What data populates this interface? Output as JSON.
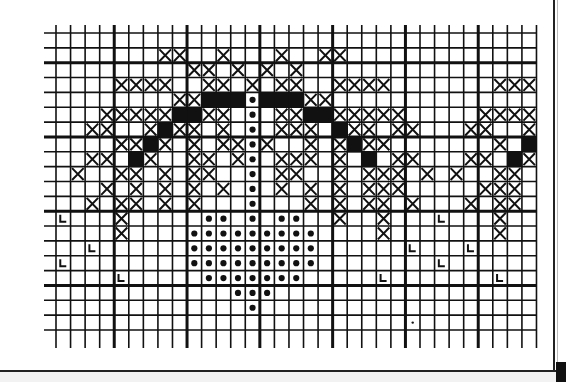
{
  "chart": {
    "grid": {
      "origin_x": 56,
      "origin_y": 33,
      "cell_w": 14.56,
      "cell_h": 14.85,
      "cols": 33,
      "rows": 20,
      "thick_every": 5,
      "thick_col_offset": 4,
      "thick_row_offset": 2,
      "line_overhang_top": 8,
      "line_overhang_bottom": 18,
      "line_overhang_left": 12
    },
    "legend": {
      "X": "cross-stitch",
      "B": "solid filled stitch",
      "D": "dot stitch",
      "L": "L-symbol stitch",
      "s": "small dot"
    },
    "colors": {
      "ink": "#111111",
      "paper": "#ffffff"
    },
    "rows": [
      {
        "X": [],
        "B": [],
        "D": [],
        "L": []
      },
      {
        "X": [
          7,
          8,
          11,
          15,
          18,
          19
        ],
        "B": [],
        "D": [],
        "L": []
      },
      {
        "X": [
          9,
          10,
          12,
          14,
          16
        ],
        "B": [],
        "D": [],
        "L": []
      },
      {
        "X": [
          4,
          5,
          6,
          7,
          10,
          11,
          13,
          15,
          16,
          19,
          20,
          21,
          22,
          30,
          31,
          32
        ],
        "B": [],
        "D": [],
        "L": []
      },
      {
        "X": [
          8,
          9,
          17,
          18
        ],
        "B": [
          10,
          11,
          12,
          14,
          15,
          16
        ],
        "D": [
          13
        ],
        "L": []
      },
      {
        "X": [
          3,
          4,
          5,
          6,
          7,
          10,
          11,
          15,
          16,
          19,
          20,
          21,
          22,
          23,
          29,
          30,
          31,
          32
        ],
        "B": [
          8,
          9,
          17,
          18
        ],
        "D": [
          13
        ],
        "L": []
      },
      {
        "X": [
          2,
          3,
          6,
          8,
          9,
          11,
          15,
          16,
          17,
          20,
          21,
          23,
          24,
          28,
          29,
          32
        ],
        "B": [
          7,
          19
        ],
        "D": [
          13
        ],
        "L": []
      },
      {
        "X": [
          4,
          5,
          7,
          9,
          11,
          12,
          14,
          17,
          19,
          21,
          22,
          30
        ],
        "B": [
          6,
          20,
          32
        ],
        "D": [
          13
        ],
        "L": []
      },
      {
        "X": [
          2,
          3,
          6,
          9,
          10,
          12,
          15,
          16,
          17,
          19,
          23,
          24,
          28,
          29,
          32
        ],
        "B": [
          5,
          21,
          31
        ],
        "D": [
          13
        ],
        "L": []
      },
      {
        "X": [
          1,
          4,
          5,
          7,
          9,
          10,
          15,
          16,
          19,
          21,
          22,
          23,
          25,
          27,
          30,
          31
        ],
        "B": [],
        "D": [
          13
        ],
        "L": []
      },
      {
        "X": [
          3,
          5,
          7,
          9,
          11,
          15,
          17,
          19,
          21,
          22,
          23,
          29,
          30,
          31
        ],
        "B": [],
        "D": [
          13
        ],
        "L": []
      },
      {
        "X": [
          2,
          4,
          5,
          7,
          9,
          17,
          19,
          21,
          22,
          24,
          28,
          30,
          31
        ],
        "B": [],
        "D": [
          13
        ],
        "L": []
      },
      {
        "X": [
          4,
          19,
          22,
          30
        ],
        "B": [],
        "D": [
          10,
          11,
          13,
          15,
          16
        ],
        "L": [
          0,
          26
        ]
      },
      {
        "X": [
          4,
          22,
          30
        ],
        "B": [],
        "D": [
          9,
          10,
          11,
          12,
          13,
          14,
          15,
          16,
          17
        ],
        "L": []
      },
      {
        "X": [],
        "B": [],
        "D": [
          9,
          10,
          11,
          12,
          13,
          14,
          15,
          16,
          17
        ],
        "L": [
          2,
          24,
          28
        ]
      },
      {
        "X": [],
        "B": [],
        "D": [
          9,
          10,
          11,
          12,
          13,
          14,
          15,
          16,
          17
        ],
        "L": [
          0,
          26
        ]
      },
      {
        "X": [],
        "B": [],
        "D": [
          10,
          11,
          12,
          13,
          14,
          15,
          16
        ],
        "L": [
          4,
          22,
          30
        ]
      },
      {
        "X": [],
        "B": [],
        "D": [
          12,
          13,
          14
        ],
        "L": []
      },
      {
        "X": [],
        "B": [],
        "D": [
          13
        ],
        "L": []
      },
      {
        "X": [],
        "B": [],
        "D": [],
        "L": [],
        "s": [
          24
        ]
      }
    ]
  }
}
